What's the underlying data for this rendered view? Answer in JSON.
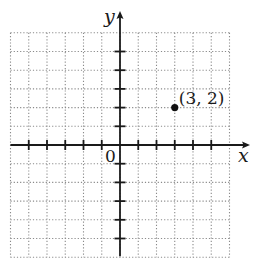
{
  "figure": {
    "axes": {
      "x_label": "x",
      "y_label": "y",
      "origin_label": "0"
    },
    "point": {
      "label": "(3, 2)",
      "x": 3,
      "y": 2
    }
  },
  "chart_data": {
    "type": "scatter",
    "title": "",
    "xlabel": "x",
    "ylabel": "y",
    "x": [
      3
    ],
    "y": [
      2
    ],
    "point_labels": [
      "(3, 2)"
    ],
    "xlim": [
      -6,
      6
    ],
    "ylim": [
      -6,
      6
    ],
    "grid": true,
    "tick_spacing": 1,
    "x_ticks": [
      -5,
      -4,
      -3,
      -2,
      -1,
      1,
      2,
      3,
      4,
      5
    ],
    "y_ticks": [
      -5,
      -4,
      -3,
      -2,
      -1,
      1,
      2,
      3,
      4,
      5
    ],
    "origin_label": "0"
  },
  "layout": {
    "origin_px": [
      120,
      145
    ],
    "unit_px_x": 18.25,
    "unit_px_y": 18.7,
    "grid_min": -6,
    "grid_max": 6
  }
}
